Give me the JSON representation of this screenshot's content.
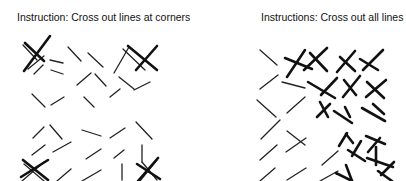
{
  "panels": [
    {
      "title": "Instruction: Cross out lines at corners",
      "lines": [
        [
          44,
          56,
          28,
          69
        ],
        [
          23,
          45,
          37,
          60
        ],
        [
          50,
          60,
          63,
          63
        ],
        [
          68,
          47,
          81,
          61
        ],
        [
          88,
          53,
          103,
          67
        ],
        [
          114,
          73,
          129,
          47
        ],
        [
          123,
          49,
          145,
          70
        ],
        [
          34,
          74,
          43,
          65
        ],
        [
          51,
          70,
          63,
          74
        ],
        [
          77,
          85,
          91,
          73
        ],
        [
          95,
          74,
          106,
          86
        ],
        [
          119,
          77,
          134,
          89
        ],
        [
          32,
          94,
          45,
          107
        ],
        [
          51,
          105,
          64,
          97
        ],
        [
          84,
          97,
          94,
          107
        ],
        [
          110,
          97,
          120,
          89
        ],
        [
          134,
          90,
          150,
          82
        ],
        [
          33,
          138,
          44,
          127
        ],
        [
          50,
          125,
          62,
          139
        ],
        [
          82,
          130,
          101,
          136
        ],
        [
          110,
          138,
          125,
          128
        ],
        [
          136,
          122,
          152,
          139
        ],
        [
          32,
          155,
          45,
          145
        ],
        [
          53,
          152,
          71,
          142
        ],
        [
          86,
          159,
          101,
          149
        ],
        [
          114,
          158,
          124,
          150
        ],
        [
          142,
          145,
          142,
          162
        ],
        [
          24,
          164,
          44,
          181
        ],
        [
          22,
          181,
          44,
          162
        ],
        [
          57,
          181,
          71,
          169
        ],
        [
          82,
          181,
          101,
          170
        ],
        [
          122,
          180,
          122,
          164
        ],
        [
          140,
          181,
          157,
          160
        ],
        [
          142,
          162,
          157,
          180
        ]
      ],
      "crossed": [
        [
          25,
          43,
          44,
          61
        ],
        [
          24,
          71,
          50,
          36
        ],
        [
          136,
          70,
          157,
          46
        ],
        [
          128,
          46,
          157,
          70
        ],
        [
          21,
          177,
          48,
          160
        ],
        [
          23,
          160,
          48,
          180
        ],
        [
          137,
          164,
          160,
          179
        ],
        [
          138,
          181,
          158,
          158
        ]
      ]
    },
    {
      "title": "Instructions: Cross out all lines",
      "lines": [
        [
          260,
          50,
          277,
          65
        ],
        [
          260,
          89,
          278,
          75
        ],
        [
          282,
          82,
          305,
          88
        ],
        [
          257,
          100,
          276,
          117
        ],
        [
          287,
          113,
          305,
          97
        ],
        [
          261,
          139,
          280,
          120
        ],
        [
          287,
          131,
          305,
          145
        ],
        [
          260,
          160,
          277,
          145
        ],
        [
          286,
          152,
          306,
          138
        ],
        [
          260,
          181,
          275,
          168
        ],
        [
          287,
          180,
          306,
          168
        ],
        [
          322,
          165,
          338,
          151
        ],
        [
          320,
          181,
          338,
          171
        ]
      ],
      "crossed": [
        [
          287,
          77,
          305,
          50
        ],
        [
          285,
          58,
          312,
          69
        ],
        [
          304,
          70,
          327,
          48
        ],
        [
          310,
          53,
          327,
          71
        ],
        [
          337,
          72,
          355,
          51
        ],
        [
          340,
          57,
          355,
          71
        ],
        [
          363,
          70,
          383,
          50
        ],
        [
          360,
          59,
          378,
          70
        ],
        [
          308,
          82,
          335,
          98
        ],
        [
          321,
          95,
          337,
          78
        ],
        [
          343,
          97,
          360,
          76
        ],
        [
          344,
          80,
          356,
          95
        ],
        [
          366,
          97,
          386,
          80
        ],
        [
          367,
          82,
          384,
          98
        ],
        [
          320,
          102,
          328,
          117
        ],
        [
          317,
          117,
          330,
          104
        ],
        [
          334,
          111,
          352,
          123
        ],
        [
          345,
          107,
          350,
          117
        ],
        [
          362,
          108,
          385,
          121
        ],
        [
          373,
          104,
          384,
          114
        ],
        [
          339,
          146,
          347,
          133
        ],
        [
          346,
          134,
          353,
          143
        ],
        [
          368,
          152,
          380,
          138
        ],
        [
          366,
          136,
          385,
          144
        ],
        [
          348,
          150,
          365,
          161
        ],
        [
          352,
          156,
          361,
          141
        ],
        [
          367,
          158,
          393,
          167
        ],
        [
          376,
          147,
          376,
          165
        ],
        [
          336,
          173,
          352,
          181
        ],
        [
          346,
          165,
          352,
          181
        ],
        [
          378,
          171,
          392,
          181
        ],
        [
          381,
          175,
          394,
          162
        ]
      ]
    }
  ]
}
